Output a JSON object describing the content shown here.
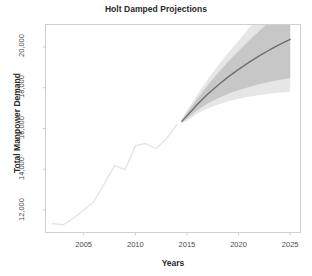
{
  "chart_data": {
    "type": "line",
    "title": "Holt Damped Projections",
    "xlabel": "Years",
    "ylabel": "Total Manpower Demand",
    "xlim": [
      2001.3,
      2026.0
    ],
    "ylim": [
      10900,
      21100
    ],
    "grid": false,
    "legend": null,
    "xticks": [
      2005,
      2010,
      2015,
      2020,
      2025
    ],
    "xtick_labels": [
      "2005",
      "2010",
      "2015",
      "2020",
      "2025"
    ],
    "yticks": [
      12000,
      14000,
      16000,
      18000,
      20000
    ],
    "ytick_labels": [
      "12,000",
      "14,000",
      "16,000",
      "18,000",
      "20,000"
    ],
    "colors": {
      "historical_line": "#e6e6e6",
      "forecast_line": "#6e6e6e",
      "band_80": "#bfbfbf",
      "band_95": "#dedede",
      "axis": "#cfcfcf",
      "text": "#2a2a2a"
    },
    "series": [
      {
        "name": "Historical",
        "type": "line",
        "x": [
          2002,
          2003,
          2004,
          2005,
          2006,
          2007,
          2008,
          2009,
          2010,
          2011,
          2012,
          2013,
          2014
        ],
        "values": [
          11340,
          11270,
          11600,
          12000,
          12420,
          13300,
          14180,
          13980,
          15150,
          15260,
          15010,
          15500,
          16170
        ]
      },
      {
        "name": "Holt Damped Forecast",
        "type": "line",
        "x": [
          2014.5,
          2015,
          2016,
          2017,
          2018,
          2019,
          2020,
          2021,
          2022,
          2023,
          2024,
          2025
        ],
        "values": [
          16350,
          16620,
          17180,
          17680,
          18120,
          18530,
          18900,
          19240,
          19560,
          19850,
          20120,
          20370
        ]
      }
    ],
    "intervals": [
      {
        "name": "95% prediction interval",
        "x": [
          2014.5,
          2015,
          2016,
          2017,
          2018,
          2019,
          2020,
          2021,
          2022,
          2023,
          2024,
          2025
        ],
        "lower": [
          16230,
          16380,
          16720,
          16980,
          17180,
          17340,
          17460,
          17560,
          17640,
          17700,
          17760,
          17800
        ],
        "upper": [
          16470,
          16880,
          17660,
          18400,
          19080,
          19720,
          20320,
          20900,
          21450,
          21980,
          22480,
          22960
        ]
      },
      {
        "name": "80% prediction interval",
        "x": [
          2014.5,
          2015,
          2016,
          2017,
          2018,
          2019,
          2020,
          2021,
          2022,
          2023,
          2024,
          2025
        ],
        "lower": [
          16290,
          16480,
          16900,
          17220,
          17480,
          17700,
          17880,
          18040,
          18170,
          18290,
          18390,
          18470
        ],
        "upper": [
          16410,
          16770,
          17460,
          18120,
          18720,
          19280,
          19800,
          20300,
          20780,
          21230,
          21660,
          22070
        ]
      }
    ]
  }
}
